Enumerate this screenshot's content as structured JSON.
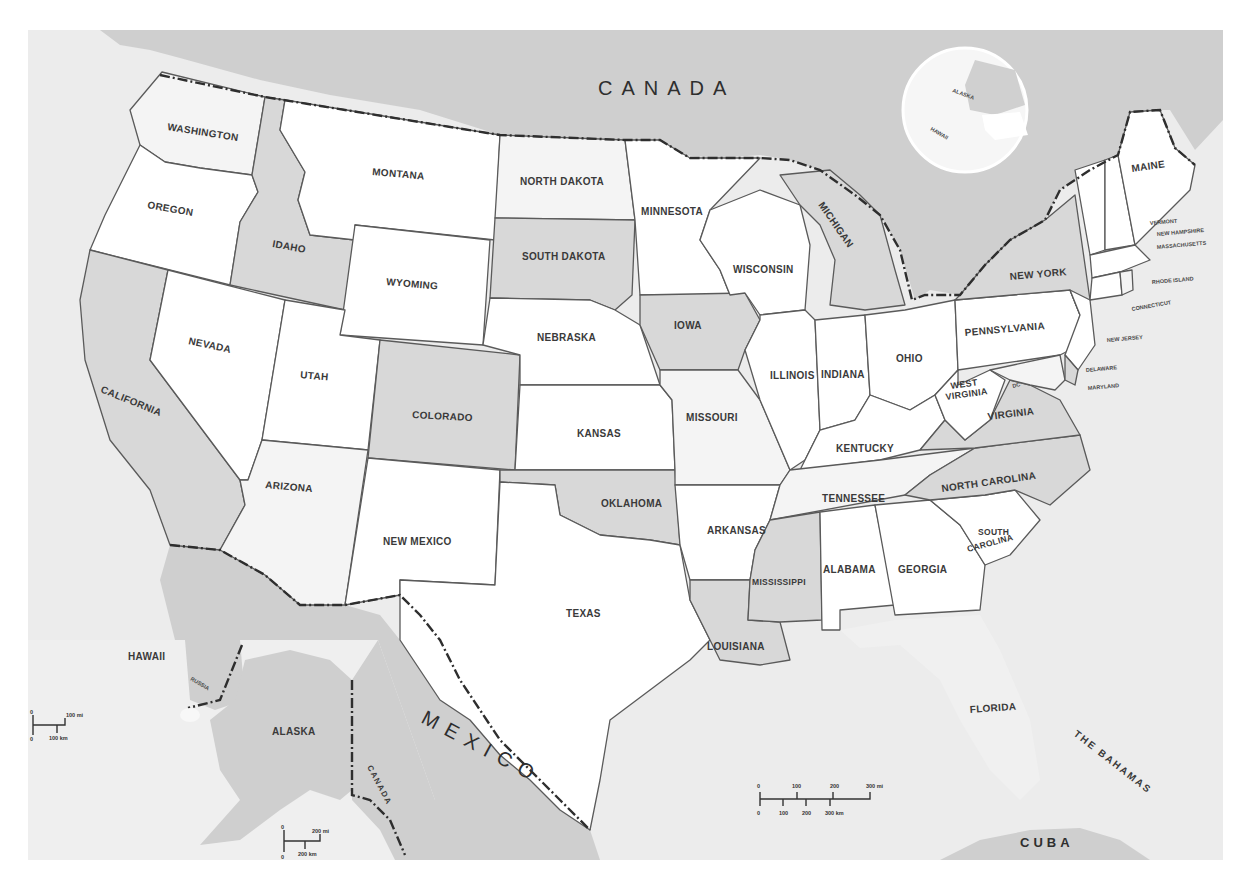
{
  "map": {
    "title": "United States",
    "countries": {
      "canada": "CANADA",
      "mexico": "MEXICO",
      "cuba": "CUBA",
      "bahamas": "THE BAHAMAS",
      "canada_inset": "CANADA"
    },
    "states": {
      "washington": "WASHINGTON",
      "oregon": "OREGON",
      "california": "CALIFORNIA",
      "nevada": "NEVADA",
      "idaho": "IDAHO",
      "montana": "MONTANA",
      "wyoming": "WYOMING",
      "utah": "UTAH",
      "arizona": "ARIZONA",
      "colorado": "COLORADO",
      "new_mexico": "NEW MEXICO",
      "north_dakota": "NORTH DAKOTA",
      "south_dakota": "SOUTH DAKOTA",
      "nebraska": "NEBRASKA",
      "kansas": "KANSAS",
      "oklahoma": "OKLAHOMA",
      "texas": "TEXAS",
      "minnesota": "MINNESOTA",
      "iowa": "IOWA",
      "missouri": "MISSOURI",
      "arkansas": "ARKANSAS",
      "louisiana": "LOUISIANA",
      "wisconsin": "WISCONSIN",
      "illinois": "ILLINOIS",
      "michigan": "MICHIGAN",
      "indiana": "INDIANA",
      "ohio": "OHIO",
      "kentucky": "KENTUCKY",
      "tennessee": "TENNESSEE",
      "mississippi": "MISSISSIPPI",
      "alabama": "ALABAMA",
      "georgia": "GEORGIA",
      "florida": "FLORIDA",
      "south_carolina_1": "SOUTH",
      "south_carolina_2": "CAROLINA",
      "north_carolina": "NORTH CAROLINA",
      "virginia": "VIRGINIA",
      "west_virginia_1": "WEST",
      "west_virginia_2": "VIRGINIA",
      "pennsylvania": "PENNSYLVANIA",
      "new_york": "NEW YORK",
      "maine": "MAINE",
      "vermont": "VERMONT",
      "new_hampshire": "NEW HAMPSHIRE",
      "massachusetts": "MASSACHUSETTS",
      "rhode_island": "RHODE ISLAND",
      "connecticut": "CONNECTICUT",
      "new_jersey": "NEW JERSEY",
      "delaware": "DELAWARE",
      "maryland": "MARYLAND",
      "dc": "DC",
      "alaska": "ALASKA",
      "hawaii": "HAWAII"
    },
    "globe_labels": {
      "alaska": "ALASKA",
      "hawaii": "HAWAII"
    },
    "inset_labels": {
      "russia": "RUSSIA"
    },
    "scales": {
      "main": {
        "mi_ticks": [
          "0",
          "100",
          "200",
          "300 mi"
        ],
        "km_ticks": [
          "0",
          "100",
          "200",
          "300 km"
        ]
      },
      "hawaii": {
        "mi": "100 mi",
        "km": "100 km",
        "zero_mi": "0",
        "zero_km": "0"
      },
      "alaska": {
        "mi": "200 mi",
        "km": "200 km",
        "zero_mi": "0",
        "zero_km": "0"
      }
    },
    "colors": {
      "background": "#ececec",
      "state_white": "#ffffff",
      "state_light": "#f4f4f4",
      "state_gray": "#d8d8d8",
      "foreign_land": "#cfcfcf",
      "border": "#5a5a5a",
      "international_border": "#2e2e2e"
    }
  }
}
